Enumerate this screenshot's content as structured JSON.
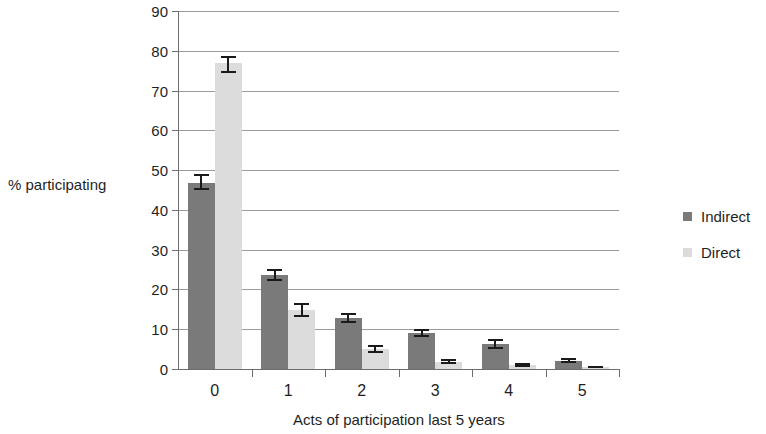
{
  "chart_data": {
    "type": "bar",
    "title": "",
    "xlabel": "Acts of participation  last 5 years",
    "ylabel": "% participating",
    "categories": [
      "0",
      "1",
      "2",
      "3",
      "4",
      "5"
    ],
    "ylim": [
      0,
      90
    ],
    "yticks": [
      0,
      10,
      20,
      30,
      40,
      50,
      60,
      70,
      80,
      90
    ],
    "grid": true,
    "legend_position": "right",
    "series": [
      {
        "name": "Indirect",
        "color": "#7a7a7a",
        "values": [
          46.7,
          23.6,
          12.8,
          9.0,
          6.3,
          2.1
        ],
        "errors_low": [
          45.0,
          22.2,
          11.6,
          8.1,
          5.1,
          1.5
        ],
        "errors_high": [
          49.0,
          25.2,
          14.0,
          10.0,
          7.5,
          2.8
        ]
      },
      {
        "name": "Direct",
        "color": "#dcdcdc",
        "values": [
          76.9,
          14.8,
          5.0,
          1.8,
          1.0,
          0.4
        ],
        "errors_low": [
          74.5,
          13.2,
          4.0,
          1.2,
          0.5,
          0.2
        ],
        "errors_high": [
          78.6,
          16.6,
          6.1,
          2.4,
          1.6,
          0.8
        ]
      }
    ]
  },
  "axis": {
    "y_title": "% participating",
    "x_title": "Acts of participation  last 5 years",
    "y_tick_labels": [
      "90",
      "80",
      "70",
      "60",
      "50",
      "40",
      "30",
      "20",
      "10",
      "0"
    ],
    "x_tick_labels": [
      "0",
      "1",
      "2",
      "3",
      "4",
      "5"
    ]
  },
  "legend": {
    "items": [
      {
        "label": "Indirect",
        "color": "#7a7a7a"
      },
      {
        "label": "Direct",
        "color": "#dcdcdc"
      }
    ]
  }
}
